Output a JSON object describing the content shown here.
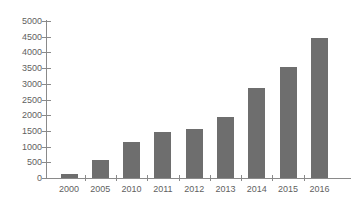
{
  "chart_data": {
    "type": "bar",
    "title": "",
    "subtitle": "",
    "xlabel": "",
    "ylabel": "",
    "categories": [
      "2000",
      "2005",
      "2010",
      "2011",
      "2012",
      "2013",
      "2014",
      "2015",
      "2016"
    ],
    "values": [
      140,
      570,
      1140,
      1480,
      1560,
      1950,
      2860,
      3520,
      4470
    ],
    "series": [
      {
        "name": "",
        "values": [
          140,
          570,
          1140,
          1480,
          1560,
          1950,
          2860,
          3520,
          4470
        ]
      }
    ],
    "ylim": [
      0,
      5000
    ],
    "yticks": [
      0,
      500,
      1000,
      1500,
      2000,
      2500,
      3000,
      3500,
      4000,
      4500,
      5000
    ],
    "ytick_labels": [
      "0",
      "500",
      "1000",
      "1500",
      "2000",
      "2500",
      "3000",
      "3500",
      "4000",
      "4500",
      "5000"
    ],
    "grid": false,
    "legend": false,
    "legend_position": "none",
    "annotations": [],
    "colors": {
      "bar_fill": "#6e6e6e",
      "axis": "#8a8a8a",
      "tick_label": "#5f5f5f",
      "background": "#ffffff"
    }
  }
}
